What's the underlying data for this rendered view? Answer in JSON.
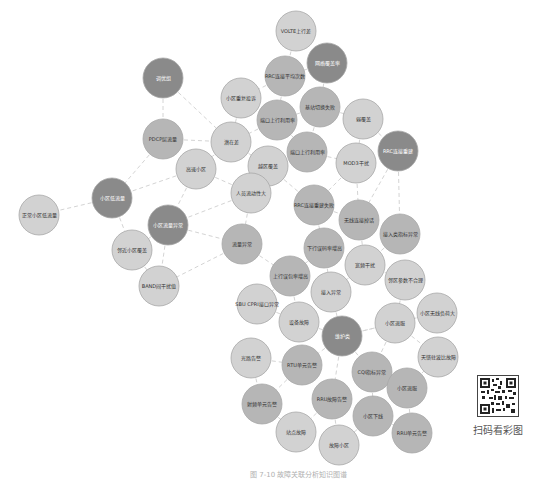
{
  "diagram": {
    "colors": {
      "dark": "#8a8a8a",
      "medium": "#b6b6b6",
      "light": "#d2d2d2",
      "stroke": "#a8a8a8",
      "edge": "#d4d4d4",
      "text_on_dark": "#ffffff",
      "text_on_light": "#333333"
    },
    "nodes": [
      {
        "id": "n1",
        "label": "VOLTE上行差",
        "x": 296,
        "y": 31,
        "shade": "light"
      },
      {
        "id": "n2",
        "label": "网络覆盖率",
        "x": 327,
        "y": 63,
        "shade": "dark"
      },
      {
        "id": "n3",
        "label": "RRC连接平均次数",
        "x": 285,
        "y": 76,
        "shade": "medium"
      },
      {
        "id": "n4",
        "label": "调优组",
        "x": 163,
        "y": 78,
        "shade": "dark"
      },
      {
        "id": "n5",
        "label": "小区重复投诉",
        "x": 241,
        "y": 98,
        "shade": "light"
      },
      {
        "id": "n6",
        "label": "基站切换失败",
        "x": 320,
        "y": 107,
        "shade": "medium"
      },
      {
        "id": "n7",
        "label": "端口上行利用率",
        "x": 277,
        "y": 120,
        "shade": "medium"
      },
      {
        "id": "n8",
        "label": "弱覆盖",
        "x": 363,
        "y": 119,
        "shade": "light"
      },
      {
        "id": "n9",
        "label": "PDCP层流量",
        "x": 163,
        "y": 139,
        "shade": "medium"
      },
      {
        "id": "n10",
        "label": "潜在差",
        "x": 231,
        "y": 142,
        "shade": "light"
      },
      {
        "id": "n11",
        "label": "RRC连接重建",
        "x": 398,
        "y": 151,
        "shade": "dark"
      },
      {
        "id": "n12",
        "label": "端口上行利用率",
        "x": 307,
        "y": 152,
        "shade": "medium"
      },
      {
        "id": "n13",
        "label": "高速小区",
        "x": 196,
        "y": 169,
        "shade": "light"
      },
      {
        "id": "n14",
        "label": "MOD3干扰",
        "x": 356,
        "y": 163,
        "shade": "light"
      },
      {
        "id": "n15",
        "label": "越区覆盖",
        "x": 268,
        "y": 166,
        "shade": "light"
      },
      {
        "id": "n16",
        "label": "人员流动性大",
        "x": 251,
        "y": 193,
        "shade": "light"
      },
      {
        "id": "n17",
        "label": "小区低流量",
        "x": 112,
        "y": 198,
        "shade": "dark"
      },
      {
        "id": "n18",
        "label": "正常小区低流量",
        "x": 39,
        "y": 215,
        "shade": "light"
      },
      {
        "id": "n19",
        "label": "RRC连接重建失败",
        "x": 314,
        "y": 205,
        "shade": "medium"
      },
      {
        "id": "n20",
        "label": "小区流量异常",
        "x": 168,
        "y": 225,
        "shade": "dark"
      },
      {
        "id": "n21",
        "label": "无线连接掉话",
        "x": 359,
        "y": 220,
        "shade": "medium"
      },
      {
        "id": "n22",
        "label": "接入类指标异常",
        "x": 400,
        "y": 234,
        "shade": "medium"
      },
      {
        "id": "n23",
        "label": "流量异常",
        "x": 242,
        "y": 244,
        "shade": "medium"
      },
      {
        "id": "n24",
        "label": "邻近小区覆盖",
        "x": 132,
        "y": 250,
        "shade": "light"
      },
      {
        "id": "n25",
        "label": "下行误码率增高",
        "x": 324,
        "y": 248,
        "shade": "medium"
      },
      {
        "id": "n26",
        "label": "宽频干扰",
        "x": 365,
        "y": 265,
        "shade": "light"
      },
      {
        "id": "n27",
        "label": "BAND间干扰值",
        "x": 159,
        "y": 286,
        "shade": "light"
      },
      {
        "id": "n28",
        "label": "上行误包率增高",
        "x": 290,
        "y": 276,
        "shade": "medium"
      },
      {
        "id": "n29",
        "label": "邻区参数不合理",
        "x": 405,
        "y": 280,
        "shade": "light"
      },
      {
        "id": "n30",
        "label": "接入异常",
        "x": 331,
        "y": 292,
        "shade": "light"
      },
      {
        "id": "n31",
        "label": "SBU CPRI接口异常",
        "x": 257,
        "y": 304,
        "shade": "light"
      },
      {
        "id": "n32",
        "label": "小区无线负荷大",
        "x": 437,
        "y": 313,
        "shade": "light"
      },
      {
        "id": "n33",
        "label": "设备故障",
        "x": 299,
        "y": 322,
        "shade": "light"
      },
      {
        "id": "n34",
        "label": "小区退服",
        "x": 395,
        "y": 323,
        "shade": "light"
      },
      {
        "id": "n35",
        "label": "维护类",
        "x": 342,
        "y": 336,
        "shade": "dark"
      },
      {
        "id": "n36",
        "label": "光路告警",
        "x": 251,
        "y": 358,
        "shade": "light"
      },
      {
        "id": "n37",
        "label": "天馈驻波比故障",
        "x": 438,
        "y": 357,
        "shade": "light"
      },
      {
        "id": "n38",
        "label": "RTU单元告警",
        "x": 302,
        "y": 365,
        "shade": "medium"
      },
      {
        "id": "n39",
        "label": "CQI指标异常",
        "x": 372,
        "y": 372,
        "shade": "medium"
      },
      {
        "id": "n40",
        "label": "小区退服",
        "x": 407,
        "y": 388,
        "shade": "medium"
      },
      {
        "id": "n41",
        "label": "射频单元告警",
        "x": 262,
        "y": 404,
        "shade": "medium"
      },
      {
        "id": "n42",
        "label": "RRU故障告警",
        "x": 332,
        "y": 399,
        "shade": "medium"
      },
      {
        "id": "n43",
        "label": "小区下线",
        "x": 373,
        "y": 416,
        "shade": "medium"
      },
      {
        "id": "n44",
        "label": "站点故障",
        "x": 296,
        "y": 432,
        "shade": "light"
      },
      {
        "id": "n45",
        "label": "故障小区",
        "x": 339,
        "y": 445,
        "shade": "light"
      },
      {
        "id": "n46",
        "label": "RRU单元告警",
        "x": 412,
        "y": 433,
        "shade": "medium"
      }
    ],
    "edges": [
      [
        "n1",
        "n3"
      ],
      [
        "n2",
        "n6"
      ],
      [
        "n2",
        "n3"
      ],
      [
        "n3",
        "n5"
      ],
      [
        "n3",
        "n7"
      ],
      [
        "n4",
        "n9"
      ],
      [
        "n4",
        "n10"
      ],
      [
        "n5",
        "n10"
      ],
      [
        "n6",
        "n7"
      ],
      [
        "n6",
        "n8"
      ],
      [
        "n6",
        "n12"
      ],
      [
        "n7",
        "n10"
      ],
      [
        "n7",
        "n12"
      ],
      [
        "n8",
        "n14"
      ],
      [
        "n8",
        "n11"
      ],
      [
        "n9",
        "n10"
      ],
      [
        "n9",
        "n17"
      ],
      [
        "n10",
        "n13"
      ],
      [
        "n10",
        "n15"
      ],
      [
        "n12",
        "n15"
      ],
      [
        "n12",
        "n14"
      ],
      [
        "n13",
        "n17"
      ],
      [
        "n13",
        "n16"
      ],
      [
        "n13",
        "n20"
      ],
      [
        "n14",
        "n19"
      ],
      [
        "n14",
        "n21"
      ],
      [
        "n11",
        "n21"
      ],
      [
        "n11",
        "n22"
      ],
      [
        "n15",
        "n16"
      ],
      [
        "n15",
        "n19"
      ],
      [
        "n16",
        "n20"
      ],
      [
        "n16",
        "n23"
      ],
      [
        "n17",
        "n18"
      ],
      [
        "n17",
        "n24"
      ],
      [
        "n20",
        "n24"
      ],
      [
        "n20",
        "n23"
      ],
      [
        "n20",
        "n27"
      ],
      [
        "n24",
        "n27"
      ],
      [
        "n23",
        "n27"
      ],
      [
        "n23",
        "n28"
      ],
      [
        "n19",
        "n25"
      ],
      [
        "n19",
        "n21"
      ],
      [
        "n21",
        "n26"
      ],
      [
        "n22",
        "n26"
      ],
      [
        "n25",
        "n28"
      ],
      [
        "n25",
        "n30"
      ],
      [
        "n26",
        "n29"
      ],
      [
        "n26",
        "n30"
      ],
      [
        "n28",
        "n31"
      ],
      [
        "n28",
        "n33"
      ],
      [
        "n30",
        "n35"
      ],
      [
        "n31",
        "n33"
      ],
      [
        "n29",
        "n34"
      ],
      [
        "n32",
        "n34"
      ],
      [
        "n33",
        "n35"
      ],
      [
        "n34",
        "n35"
      ],
      [
        "n34",
        "n37"
      ],
      [
        "n35",
        "n39"
      ],
      [
        "n35",
        "n38"
      ],
      [
        "n35",
        "n42"
      ],
      [
        "n36",
        "n38"
      ],
      [
        "n36",
        "n41"
      ],
      [
        "n38",
        "n41"
      ],
      [
        "n39",
        "n40"
      ],
      [
        "n39",
        "n43"
      ],
      [
        "n40",
        "n46"
      ],
      [
        "n41",
        "n44"
      ],
      [
        "n42",
        "n44"
      ],
      [
        "n42",
        "n45"
      ],
      [
        "n43",
        "n45"
      ],
      [
        "n43",
        "n46"
      ],
      [
        "n34",
        "n39"
      ],
      [
        "n35",
        "n34"
      ],
      [
        "n40",
        "n37"
      ]
    ],
    "node_radius": 20
  },
  "caption": "图 7-10 故障关联分析知识图谱",
  "qr": {
    "label": "扫码看彩图"
  }
}
